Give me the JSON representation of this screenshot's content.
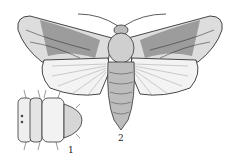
{
  "figure": {
    "labels": [
      {
        "id": "1",
        "text": "1",
        "describes": "larva / pupa segment (dorsal view)"
      },
      {
        "id": "2",
        "text": "2",
        "describes": "adult moth (dorsal view, wings spread)"
      }
    ],
    "colors": {
      "ink": "#2a2a2a",
      "paper": "#ffffff",
      "shade": "#555555"
    }
  }
}
